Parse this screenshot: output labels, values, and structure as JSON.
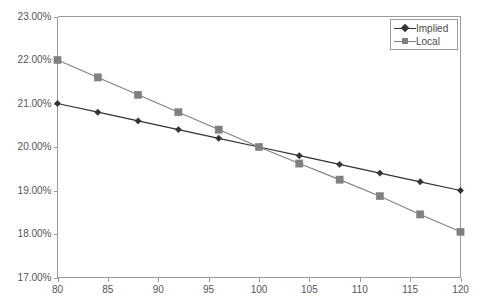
{
  "chart_data": {
    "type": "line",
    "title": "",
    "subtitle": "",
    "xlabel": "",
    "ylabel": "",
    "xlim": [
      80,
      120
    ],
    "ylim": [
      17,
      23
    ],
    "grid": false,
    "legend_position": "top-right",
    "x_ticks": [
      80,
      85,
      90,
      95,
      100,
      105,
      110,
      115,
      120
    ],
    "x_tick_labels": [
      "80",
      "85",
      "90",
      "95",
      "100",
      "105",
      "110",
      "115",
      "120"
    ],
    "y_ticks": [
      17,
      18,
      19,
      20,
      21,
      22,
      23
    ],
    "y_tick_labels": [
      "17.00%",
      "18.00%",
      "19.00%",
      "20.00%",
      "21.00%",
      "22.00%",
      "23.00%"
    ],
    "x": [
      80,
      84,
      88,
      92,
      96,
      100,
      104,
      108,
      112,
      116,
      120
    ],
    "series": [
      {
        "name": "Implied",
        "color": "#333333",
        "marker": "diamond",
        "values": [
          21.0,
          20.8,
          20.6,
          20.4,
          20.2,
          20.0,
          19.8,
          19.6,
          19.4,
          19.2,
          19.0
        ]
      },
      {
        "name": "Local",
        "color": "#808080",
        "marker": "square",
        "values": [
          22.0,
          21.6,
          21.2,
          20.8,
          20.4,
          20.0,
          19.62,
          19.25,
          18.87,
          18.45,
          18.05
        ]
      }
    ],
    "annotations": []
  },
  "legend": {
    "items": [
      {
        "label": "Implied"
      },
      {
        "label": "Local"
      }
    ]
  },
  "axes": {
    "axis_color": "#9a9a9a",
    "tick_color": "#9a9a9a",
    "label_color": "#555555"
  }
}
